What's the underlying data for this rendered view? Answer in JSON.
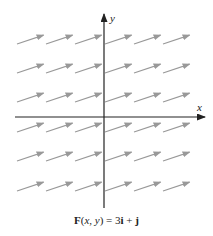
{
  "figure": {
    "x_axis_label": "x",
    "y_axis_label": "y",
    "caption": {
      "F": "F",
      "args_open": "(",
      "x": "x",
      "comma": ", ",
      "y": "y",
      "args_close": ") = 3",
      "i": "i",
      "plus": " + ",
      "j": "j"
    },
    "colors": {
      "axis": "#222222",
      "vector": "#999999"
    },
    "vector_field": {
      "expression": "F(x, y) = 3i + j",
      "columns": 6,
      "rows": 6,
      "vector_direction": [
        3,
        1
      ]
    }
  }
}
